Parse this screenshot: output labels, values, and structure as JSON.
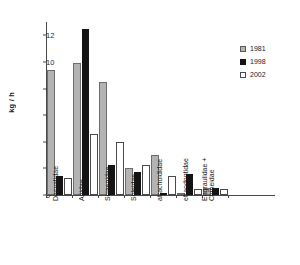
{
  "chart_data": {
    "type": "bar",
    "title": "",
    "xlabel": "",
    "ylabel": "kg / h",
    "ylim": [
      0,
      13
    ],
    "yticks": [
      0,
      2,
      4,
      6,
      8,
      10,
      12
    ],
    "grid": false,
    "legend_position": "right",
    "categories": [
      "Dasyatidae",
      "Ariidae",
      "Sciaenidae",
      "Soleidae",
      "atrachoididae",
      "etraodontidae",
      "Engraulidae +\nClupeidae"
    ],
    "series": [
      {
        "name": "1981",
        "color": "#b3b3b3",
        "values": [
          9.4,
          9.9,
          8.5,
          2.05,
          3.0,
          0.15,
          0.55
        ]
      },
      {
        "name": "1998",
        "color": "#141414",
        "values": [
          1.4,
          12.5,
          2.25,
          1.75,
          0.15,
          1.55,
          0.55
        ]
      },
      {
        "name": "2002",
        "color": "#ffffff",
        "values": [
          1.25,
          4.6,
          3.95,
          2.25,
          1.45,
          0.45,
          0.45
        ]
      }
    ]
  },
  "legend": {
    "items": [
      {
        "label": "1981"
      },
      {
        "label": "1998"
      },
      {
        "label": "2002"
      }
    ]
  },
  "axes": {
    "y_title": "kg / h",
    "y_ticklabels": [
      "0",
      "2",
      "4",
      "6",
      "8",
      "10",
      "12"
    ]
  }
}
